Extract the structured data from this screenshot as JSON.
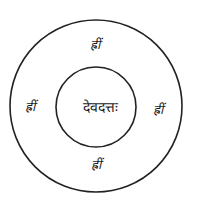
{
  "diagram": {
    "type": "concentric-circles-yantra",
    "center_text": "देवदत्तः",
    "ring_texts": [
      {
        "position": "top",
        "text": "ह्रीं"
      },
      {
        "position": "left",
        "text": "ह्रीं"
      },
      {
        "position": "right",
        "text": "ह्रीं"
      },
      {
        "position": "bottom",
        "text": "ह्रीं"
      }
    ],
    "colors": {
      "stroke": "#222222",
      "background": "#ffffff"
    }
  }
}
